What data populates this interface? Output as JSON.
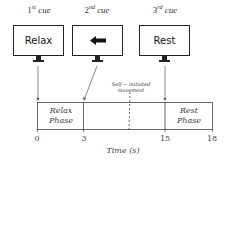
{
  "cues": [
    {
      "ordinal": "1",
      "suffix": "st",
      "word": "cue",
      "screen_text": "Relax",
      "icon": null
    },
    {
      "ordinal": "2",
      "suffix": "nd",
      "word": "cue",
      "screen_text": "",
      "icon": "left-arrow-icon"
    },
    {
      "ordinal": "3",
      "suffix": "rd",
      "word": "cue",
      "screen_text": "Rest",
      "icon": null
    }
  ],
  "annotation": {
    "line1": "Self − initiated",
    "line2": "movement"
  },
  "phases": [
    {
      "line1": "Relax",
      "line2": "Phase"
    },
    {
      "line1": "Rest",
      "line2": "Phase"
    }
  ],
  "timeline": {
    "ticks": [
      "0",
      "3",
      "15",
      "18"
    ],
    "axis_title": "Time (s)"
  },
  "colors": {
    "line": "#222222",
    "text": "#444444",
    "background": "#ffffff"
  }
}
